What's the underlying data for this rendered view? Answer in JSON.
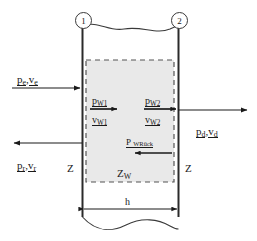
{
  "diagram": {
    "nodes": [
      {
        "name": "node-1",
        "label": "1"
      },
      {
        "name": "node-2",
        "label": "2"
      }
    ],
    "flows": {
      "incident": {
        "pressure": "p",
        "pressure_sub": "e",
        "velocity": "v",
        "velocity_sub": "e",
        "separator": ","
      },
      "reflected": {
        "pressure": "p",
        "pressure_sub": "r",
        "velocity": "v",
        "velocity_sub": "r",
        "separator": ","
      },
      "transmitted": {
        "pressure": "p",
        "pressure_sub": "d",
        "velocity": "v",
        "velocity_sub": "d",
        "separator": ","
      }
    },
    "wall_quantities": [
      {
        "name": "p-w1",
        "symbol": "p",
        "sub": "W1"
      },
      {
        "name": "v-w1",
        "symbol": "v",
        "sub": "W1"
      },
      {
        "name": "p-w2",
        "symbol": "p",
        "sub": "W2"
      },
      {
        "name": "v-w2",
        "symbol": "v",
        "sub": "W2"
      },
      {
        "name": "p-wrueck",
        "symbol": "P",
        "sub": "WRück",
        "display": "P WRück"
      }
    ],
    "impedances": {
      "left": "Z",
      "right": "Z",
      "wall_symbol": "Z",
      "wall_sub": "W"
    },
    "dimension": {
      "label": "h"
    },
    "colors": {
      "line": "#1a1a1a",
      "wall": "#2a2a2a",
      "dashed_box_fill": "#e9e9e9",
      "dashed_box_stroke": "#555555",
      "node_circle_stroke": "#3a3a3a",
      "background": "#ffffff"
    }
  }
}
